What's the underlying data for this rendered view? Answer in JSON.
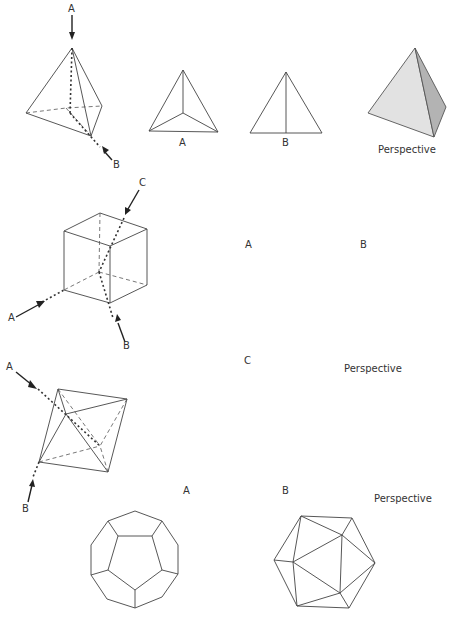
{
  "figure": {
    "rows": [
      {
        "solid": "tetrahedron",
        "axis_labels": [
          "A",
          "B"
        ],
        "view_labels": [
          "A",
          "B"
        ],
        "perspective_label": "Perspective",
        "colors": {
          "face_light": "#e4e4e4",
          "face_dark": "#b5b5b5"
        }
      },
      {
        "solid": "cube",
        "axis_labels": [
          "A",
          "B",
          "C"
        ],
        "view_labels": [
          "A",
          "B",
          "C"
        ],
        "perspective_label": "Perspective"
      },
      {
        "solid": "octahedron",
        "axis_labels": [
          "A",
          "B"
        ],
        "view_labels": [
          "A",
          "B"
        ],
        "perspective_label": "Perspective"
      },
      {
        "solid": "dodecahedron / icosahedron",
        "view_solids": [
          "dodecahedron",
          "icosahedron"
        ]
      }
    ]
  }
}
